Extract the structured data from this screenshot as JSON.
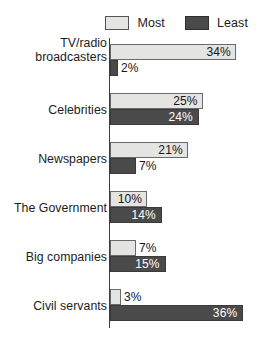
{
  "legend": {
    "items": [
      {
        "label": "Most",
        "key": "most",
        "color": "#e4e4e2"
      },
      {
        "label": "Least",
        "key": "least",
        "color": "#4a4a4a"
      }
    ]
  },
  "chart_data": {
    "type": "bar",
    "orientation": "horizontal",
    "title": "",
    "subtitle": "",
    "xlabel": "",
    "ylabel": "",
    "grid": false,
    "legend_position": "top-right",
    "axis_visible": true,
    "value_suffix": "%",
    "xlim": [
      0,
      36
    ],
    "categories": [
      "TV/radio broadcasters",
      "Celebrities",
      "Newspapers",
      "The Government",
      "Big companies",
      "Civil servants"
    ],
    "category_lines": [
      [
        "TV/radio",
        "broadcasters"
      ],
      [
        "Celebrities"
      ],
      [
        "Newspapers"
      ],
      [
        "The Government"
      ],
      [
        "Big companies"
      ],
      [
        "Civil servants"
      ]
    ],
    "series": [
      {
        "name": "Most",
        "values": [
          34,
          25,
          21,
          10,
          7,
          3
        ]
      },
      {
        "name": "Least",
        "values": [
          2,
          24,
          7,
          14,
          15,
          36
        ]
      }
    ],
    "data_labels": {
      "most": [
        "34%",
        "25%",
        "21%",
        "10%",
        "7%",
        "3%"
      ],
      "least": [
        "2%",
        "24%",
        "7%",
        "14%",
        "15%",
        "36%"
      ]
    }
  }
}
